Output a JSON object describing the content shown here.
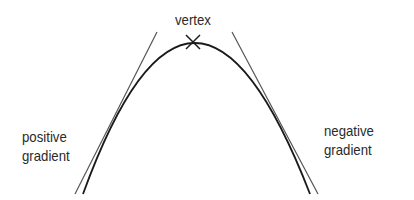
{
  "diagram": {
    "labels": {
      "vertex": "vertex",
      "left_line1": "positive",
      "left_line2": "gradient",
      "right_line1": "negative",
      "right_line2": "gradient"
    },
    "colors": {
      "curve": "#1a1a1a",
      "tangent": "#555555",
      "text": "#2a2a2a"
    }
  }
}
